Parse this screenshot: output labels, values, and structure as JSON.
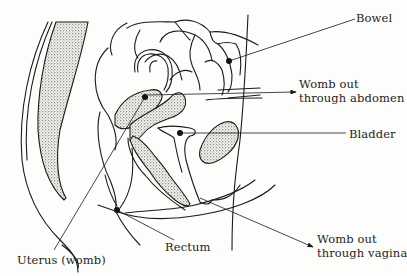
{
  "diagram": {
    "type": "anatomical-cross-section",
    "labels": {
      "bowel": "Bowel",
      "womb_abdomen_line1": "Womb out",
      "womb_abdomen_line2": "through abdomen",
      "bladder": "Bladder",
      "womb_vagina_line1": "Womb out",
      "womb_vagina_line2": "through vagina",
      "rectum": "Rectum",
      "uterus": "Uterus (womb)"
    },
    "colors": {
      "ink": "#1a1a1a",
      "paper": "#fdfdfb"
    }
  }
}
